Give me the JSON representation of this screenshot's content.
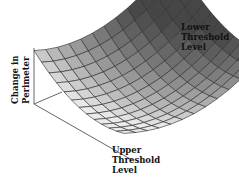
{
  "chart_data": {
    "type": "surface",
    "title": "",
    "zlabel": "Change in Perimeter",
    "xlabel": "Upper Threshold Level",
    "ylabel": "Lower Threshold Level",
    "grid": true,
    "colormap": "grayscale",
    "shape": "bowl / saddle-like surface, highest at far corner, low flat region near the front-right, rising edges",
    "grid_size": [
      12,
      12
    ]
  },
  "labels": {
    "zlabel_line1": "Change in",
    "zlabel_line2": "Perimeter",
    "lower_line1": "Lower",
    "lower_line2": "Threshold",
    "lower_line3": "Level",
    "upper_line1": "Upper",
    "upper_line2": "Threshold",
    "upper_line3": "Level"
  }
}
